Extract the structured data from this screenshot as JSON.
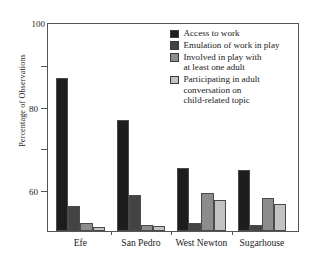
{
  "chart_data": {
    "type": "bar",
    "title": "",
    "xlabel": "",
    "ylabel": "Percentage of Observations",
    "ylim": [
      0,
      100
    ],
    "yticks": [
      0,
      20,
      40,
      60,
      80,
      100
    ],
    "grid": false,
    "legend_position": "top-right inside plot",
    "categories": [
      "Efe",
      "San Pedro",
      "West Newton",
      "Sugarhouse"
    ],
    "series": [
      {
        "name": "Access to work",
        "color": "#1d1d1d",
        "values": [
          73,
          53,
          30,
          29
        ]
      },
      {
        "name": "Emulation of work in play",
        "color": "#434343",
        "values": [
          12,
          17,
          4,
          3
        ]
      },
      {
        "name": "Involved in play with at least one adult",
        "color": "#8c8c8c",
        "values": [
          4,
          3,
          18,
          16
        ]
      },
      {
        "name": "Participating in adult conversation on child-related topic",
        "color": "#c2c2c2",
        "values": [
          2,
          2.5,
          15,
          13
        ]
      }
    ]
  },
  "legend": {
    "items": [
      {
        "line1": "Access to work",
        "line2": "",
        "line3": "",
        "color": "#1d1d1d"
      },
      {
        "line1": "Emulation of work in play",
        "line2": "",
        "line3": "",
        "color": "#434343"
      },
      {
        "line1": "Involved in play with",
        "line2": "at least one adult",
        "line3": "",
        "color": "#8c8c8c"
      },
      {
        "line1": "Participating in adult",
        "line2": "conversation on",
        "line3": "child-related topic",
        "color": "#c2c2c2"
      }
    ]
  },
  "axes": {
    "y_title": "Percentage of Observations",
    "y_tick_labels": [
      "0",
      "20",
      "40",
      "60",
      "80",
      "100"
    ],
    "x_tick_labels": [
      "Efe",
      "San Pedro",
      "West Newton",
      "Sugarhouse"
    ]
  }
}
